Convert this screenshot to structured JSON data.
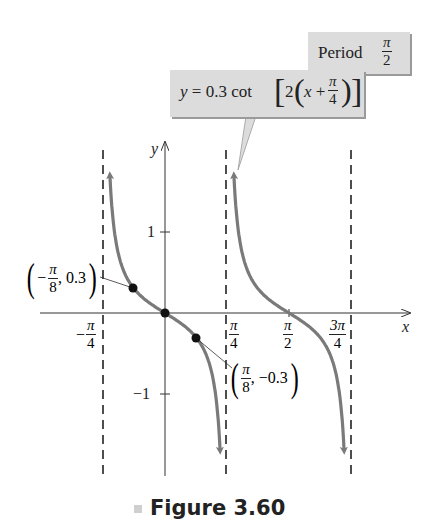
{
  "chart_data": {
    "type": "line",
    "title": "Figure 3.60",
    "equation": "y = 0.3 cot[2(x + π/4)]",
    "period_label": "Period π/2",
    "xlabel": "x",
    "ylabel": "y",
    "x_ticks": [
      {
        "value": -0.785398,
        "label": "-π/4"
      },
      {
        "value": 0.785398,
        "label": "π/4"
      },
      {
        "value": 1.570796,
        "label": "π/2"
      },
      {
        "value": 2.356194,
        "label": "3π/4"
      }
    ],
    "y_ticks": [
      {
        "value": 1,
        "label": "1"
      },
      {
        "value": -1,
        "label": "-1"
      }
    ],
    "asymptotes_x": [
      -0.785398,
      0.785398,
      2.356194
    ],
    "asymptote_labels": [
      "x = -π/4",
      "x = π/4",
      "x = 3π/4"
    ],
    "labeled_points": [
      {
        "x": -0.392699,
        "y": 0.3,
        "label": "(-π/8, 0.3)"
      },
      {
        "x": 0,
        "y": 0,
        "label": ""
      },
      {
        "x": 0.392699,
        "y": -0.3,
        "label": "(π/8, -0.3)"
      }
    ],
    "zeros_x": [
      0,
      1.570796
    ],
    "xlim": [
      -1.05,
      3.05
    ],
    "ylim": [
      -1.95,
      1.95
    ],
    "grid": false,
    "legend": "none"
  },
  "labels": {
    "equation_prefix": "y = 0.3 cot",
    "equation_inner_lead": "2",
    "equation_x": "x + ",
    "pi": "π",
    "four": "4",
    "two": "2",
    "eight": "8",
    "three_pi": "3π",
    "period_word": "Period",
    "y_axis": "y",
    "x_axis": "x",
    "tick_one": "1",
    "tick_neg_one": "−1",
    "neg_sign": "−",
    "point_left_value": ", 0.3",
    "point_right_value": ", −0.3",
    "caption": "Figure 3.60"
  },
  "colors": {
    "curve": "#7a7a7a",
    "axis": "#333333",
    "asymptote": "#222222",
    "callout_bg": "#dcdcdc",
    "callout_shadow": "#9a9a9a",
    "point": "#111111"
  }
}
